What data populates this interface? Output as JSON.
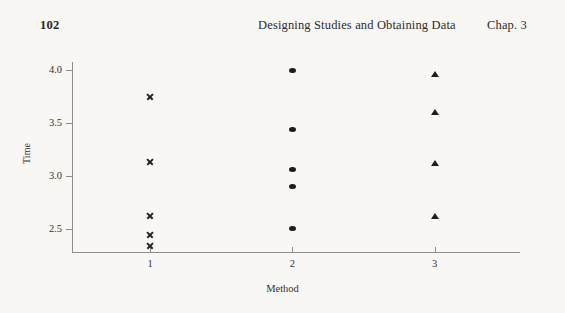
{
  "page": {
    "number": "102",
    "running_head": "Designing Studies and Obtaining Data",
    "chapter": "Chap. 3",
    "background_color": "#f8f7f4",
    "ink_color": "#2b2b2b"
  },
  "chart_data": {
    "type": "scatter",
    "title": "",
    "xlabel": "Method",
    "ylabel": "Time",
    "xlim": [
      0.45,
      3.6
    ],
    "ylim": [
      2.28,
      4.08
    ],
    "grid": false,
    "legend": "none",
    "x_tick_labels": [
      "1",
      "2",
      "3"
    ],
    "x_tick_values": [
      1,
      2,
      3
    ],
    "y_tick_labels": [
      "4.0",
      "3.5",
      "3.0",
      "2.5"
    ],
    "y_tick_values": [
      4.0,
      3.5,
      3.0,
      2.5
    ],
    "series": [
      {
        "name": "Method 1",
        "marker": "cross",
        "marker_color": "#222222",
        "x": [
          1,
          1,
          1,
          1,
          1
        ],
        "values": [
          3.75,
          3.14,
          2.62,
          2.44,
          2.34
        ]
      },
      {
        "name": "Method 2",
        "marker": "circle",
        "marker_color": "#1d1d1d",
        "x": [
          2,
          2,
          2,
          2,
          2
        ],
        "values": [
          4.0,
          3.44,
          3.06,
          2.9,
          2.5
        ]
      },
      {
        "name": "Method 3",
        "marker": "triangle",
        "marker_color": "#1d1d1d",
        "x": [
          3,
          3,
          3,
          3
        ],
        "values": [
          3.96,
          3.6,
          3.12,
          2.62
        ]
      }
    ]
  }
}
